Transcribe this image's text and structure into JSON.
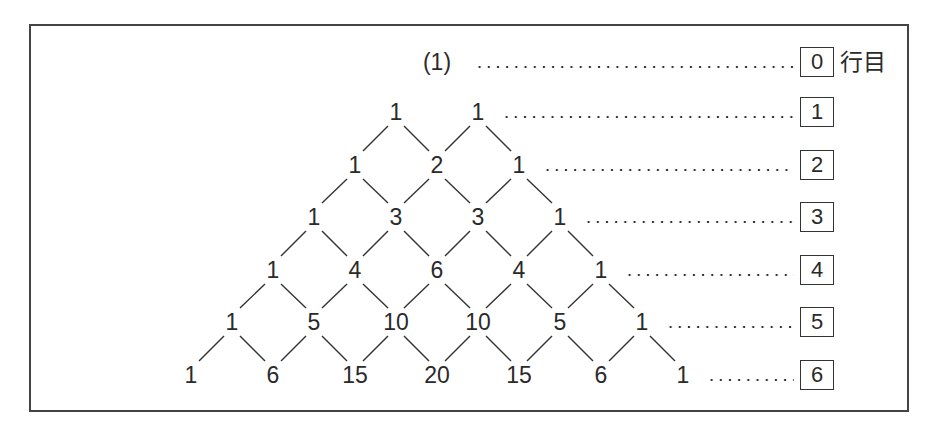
{
  "figure": {
    "row_suffix": "行目",
    "rows": [
      {
        "label": "0",
        "values": [
          "(1)"
        ]
      },
      {
        "label": "1",
        "values": [
          "1",
          "1"
        ]
      },
      {
        "label": "2",
        "values": [
          "1",
          "2",
          "1"
        ]
      },
      {
        "label": "3",
        "values": [
          "1",
          "3",
          "3",
          "1"
        ]
      },
      {
        "label": "4",
        "values": [
          "1",
          "4",
          "6",
          "4",
          "1"
        ]
      },
      {
        "label": "5",
        "values": [
          "1",
          "5",
          "10",
          "10",
          "5",
          "1"
        ]
      },
      {
        "label": "6",
        "values": [
          "1",
          "6",
          "15",
          "20",
          "15",
          "6",
          "1"
        ]
      }
    ]
  },
  "colors": {
    "ink": "#2a2a2a",
    "frame": "#444444"
  }
}
